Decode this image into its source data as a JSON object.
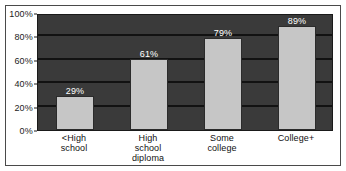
{
  "chart_data": {
    "type": "bar",
    "title": "",
    "subtitle": "",
    "xlabel": "",
    "ylabel": "",
    "categories": [
      "<High\nschool",
      "High\nschool\ndiploma",
      "Some\ncollege",
      "College+"
    ],
    "values": [
      29,
      61,
      79,
      89
    ],
    "data_labels": [
      "29%",
      "61%",
      "79%",
      "89%"
    ],
    "ylim": [
      0,
      100
    ],
    "yticks": [
      0,
      20,
      40,
      60,
      80,
      100
    ],
    "ytick_labels": [
      "0%",
      "20%",
      "40%",
      "60%",
      "80%",
      "100%"
    ],
    "grid": "horizontal",
    "legend": "none",
    "series": [
      {
        "name": "",
        "values": [
          29,
          61,
          79,
          89
        ]
      }
    ]
  },
  "style": {
    "plot_background": "#3a3a3a",
    "gridline_color": "#121212",
    "bar_fill": "#c6c6c6",
    "bar_edge": "#2b2b2b",
    "data_label_color": "#ffffff",
    "axis_text_color": "#1c1c1c",
    "canvas_background": "#ffffff",
    "frame_color": "#4a4a4a"
  }
}
